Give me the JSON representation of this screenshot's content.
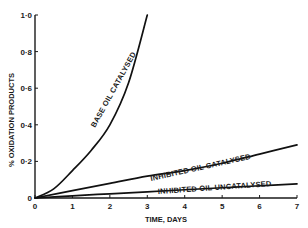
{
  "chart_data": {
    "type": "line",
    "title": "",
    "xlabel": "TIME, DAYS",
    "ylabel": "% OXIDATION PRODUCTS",
    "xlim": [
      0,
      7
    ],
    "ylim": [
      0,
      1.0
    ],
    "x_ticks": [
      "0",
      "1",
      "2",
      "3",
      "4",
      "5",
      "6",
      "7"
    ],
    "y_ticks": [
      "0",
      "0·2",
      "0·4",
      "0·6",
      "0·8",
      "1·0"
    ],
    "grid": false,
    "legend": "none (curves labelled inline)",
    "series": [
      {
        "name": "BASE OIL CATALYSED",
        "x": [
          0,
          0.5,
          1,
          1.5,
          2,
          2.5,
          3
        ],
        "values": [
          0,
          0.05,
          0.15,
          0.26,
          0.4,
          0.63,
          1.0
        ]
      },
      {
        "name": "INHIBITED OIL CATALYSED",
        "x": [
          0,
          1,
          2,
          3,
          4,
          5,
          6,
          7
        ],
        "values": [
          0,
          0.04,
          0.08,
          0.12,
          0.15,
          0.19,
          0.24,
          0.29
        ]
      },
      {
        "name": "INHIBITED OIL UNCATALYSED",
        "x": [
          0,
          1,
          2,
          3,
          4,
          5,
          6,
          7
        ],
        "values": [
          0,
          0.012,
          0.023,
          0.034,
          0.045,
          0.056,
          0.067,
          0.077
        ]
      }
    ]
  },
  "labels": {
    "ylabel": "% OXIDATION PRODUCTS",
    "xlabel": "TIME, DAYS",
    "series_0": "BASE OIL CATALYSED",
    "series_1": "INHIBITED OIL CATALYSED",
    "series_2": "INHIBITED OIL UNCATALYSED"
  }
}
